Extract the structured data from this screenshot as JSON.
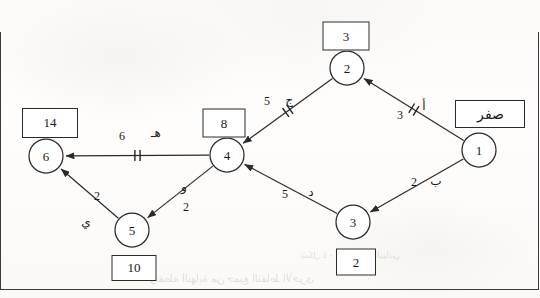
{
  "diagram": {
    "type": "directed-weighted-graph",
    "title": "",
    "language": "ar",
    "nodes": [
      {
        "id": "n1",
        "label": "1",
        "x": 479,
        "y": 150,
        "r": 17,
        "dist_box": {
          "text": "صفر",
          "arabic": true,
          "x": 490,
          "y": 114,
          "w": 70,
          "h": 28
        }
      },
      {
        "id": "n2",
        "label": "2",
        "x": 347,
        "y": 68,
        "r": 17,
        "dist_box": {
          "text": "3",
          "arabic": false,
          "x": 346,
          "y": 36,
          "w": 47,
          "h": 29
        }
      },
      {
        "id": "n3",
        "label": "3",
        "x": 353,
        "y": 222,
        "r": 17,
        "dist_box": {
          "text": "2",
          "arabic": false,
          "x": 356,
          "y": 262,
          "w": 40,
          "h": 27
        }
      },
      {
        "id": "n4",
        "label": "4",
        "x": 227,
        "y": 155,
        "r": 17,
        "dist_box": {
          "text": "8",
          "arabic": false,
          "x": 224,
          "y": 123,
          "w": 43,
          "h": 29
        }
      },
      {
        "id": "n5",
        "label": "5",
        "x": 132,
        "y": 230,
        "r": 17,
        "dist_box": {
          "text": "10",
          "arabic": false,
          "x": 134,
          "y": 268,
          "w": 45,
          "h": 26
        }
      },
      {
        "id": "n6",
        "label": "6",
        "x": 46,
        "y": 156,
        "r": 17,
        "dist_box": {
          "text": "14",
          "arabic": false,
          "x": 50,
          "y": 123,
          "w": 56,
          "h": 30
        }
      }
    ],
    "edges": [
      {
        "id": "e-a",
        "from": "n1",
        "to": "n2",
        "weight": "3",
        "name": "أ",
        "marked": true,
        "wx": 400,
        "wy": 115,
        "nx": 424,
        "ny": 106
      },
      {
        "id": "e-b",
        "from": "n1",
        "to": "n3",
        "weight": "2",
        "name": "ب",
        "marked": false,
        "wx": 414,
        "wy": 182,
        "nx": 436,
        "ny": 181
      },
      {
        "id": "e-c",
        "from": "n2",
        "to": "n4",
        "weight": "5",
        "name": "ج",
        "marked": true,
        "wx": 267,
        "wy": 101,
        "nx": 289,
        "ny": 100
      },
      {
        "id": "e-d",
        "from": "n3",
        "to": "n4",
        "weight": "5",
        "name": "د",
        "marked": false,
        "wx": 285,
        "wy": 194,
        "nx": 311,
        "ny": 192
      },
      {
        "id": "e-h",
        "from": "n4",
        "to": "n6",
        "weight": "6",
        "name": "هـ",
        "marked": true,
        "wx": 122,
        "wy": 136,
        "nx": 156,
        "ny": 133
      },
      {
        "id": "e-w",
        "from": "n4",
        "to": "n5",
        "weight": "2",
        "name": "و",
        "marked": false,
        "wx": 186,
        "wy": 207,
        "nx": 184,
        "ny": 187
      },
      {
        "id": "e-y",
        "from": "n5",
        "to": "n6",
        "weight": "2",
        "name": "ي",
        "marked": false,
        "wx": 97,
        "wy": 196,
        "nx": 86,
        "ny": 222
      }
    ]
  },
  "bleed_through": [
    {
      "text": "ونقطة النهاية من جميع النقاط الأخرى",
      "x": 150,
      "y": 272,
      "size": 11
    },
    {
      "text": "شكل ٤ - ٢ : الرسم البياني",
      "x": 300,
      "y": 250,
      "size": 9
    }
  ]
}
